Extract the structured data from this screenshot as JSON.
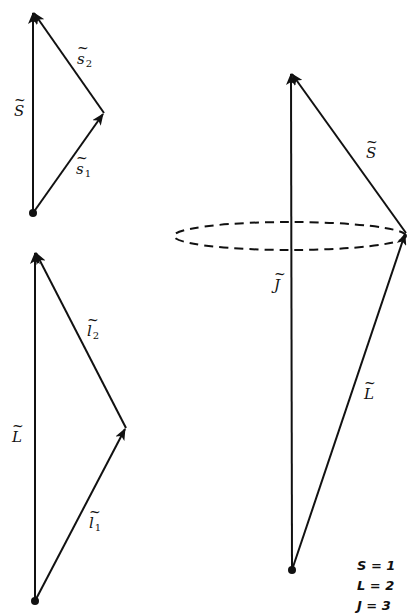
{
  "diagram": {
    "type": "vector-coupling",
    "panels": [
      {
        "name": "spin-coupling",
        "vectors": [
          {
            "label": "S",
            "sub": "",
            "from": [
              33,
              213
            ],
            "to": [
              33,
              12
            ]
          },
          {
            "label": "s",
            "sub": "1",
            "from": [
              33,
              213
            ],
            "to": [
              104,
              113
            ]
          },
          {
            "label": "s",
            "sub": "2",
            "from": [
              104,
              113
            ],
            "to": [
              33,
              12
            ]
          }
        ]
      },
      {
        "name": "orbital-coupling",
        "vectors": [
          {
            "label": "L",
            "sub": "",
            "from": [
              35,
              601
            ],
            "to": [
              35,
              252
            ]
          },
          {
            "label": "l",
            "sub": "1",
            "from": [
              35,
              601
            ],
            "to": [
              126,
              428
            ]
          },
          {
            "label": "l",
            "sub": "2",
            "from": [
              126,
              428
            ],
            "to": [
              35,
              252
            ]
          }
        ]
      },
      {
        "name": "total-angular-momentum",
        "vectors": [
          {
            "label": "J",
            "sub": "",
            "from": [
              292,
              570
            ],
            "to": [
              291,
              73
            ]
          },
          {
            "label": "L",
            "sub": "",
            "from": [
              292,
              570
            ],
            "to": [
              406,
              233
            ]
          },
          {
            "label": "S",
            "sub": "",
            "from": [
              406,
              233
            ],
            "to": [
              291,
              73
            ]
          }
        ],
        "precession_cone": {
          "cx": 290,
          "cy": 236,
          "rx": 116,
          "ry": 14,
          "style": "dashed"
        }
      }
    ],
    "labels": {
      "S_top": {
        "main": "S",
        "sub": ""
      },
      "s1": {
        "main": "s",
        "sub": "1"
      },
      "s2": {
        "main": "s",
        "sub": "2"
      },
      "L_left": {
        "main": "L",
        "sub": ""
      },
      "l1": {
        "main": "l",
        "sub": "1"
      },
      "l2": {
        "main": "l",
        "sub": "2"
      },
      "S_right": {
        "main": "S",
        "sub": ""
      },
      "J_right": {
        "main": "J",
        "sub": ""
      },
      "L_right": {
        "main": "L",
        "sub": ""
      },
      "tilde": "~"
    },
    "legend": {
      "S": "S = 1",
      "L": "L = 2",
      "J": "J = 3"
    }
  }
}
